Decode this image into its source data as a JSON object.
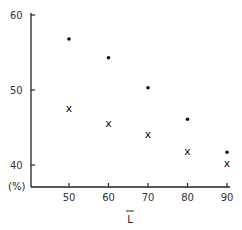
{
  "chart_data": {
    "type": "scatter",
    "title": "",
    "xlabel": "L̄",
    "ylabel": "(%)",
    "x": [
      50,
      60,
      70,
      80,
      90
    ],
    "series": [
      {
        "name": "dot",
        "marker": "•",
        "values": [
          56.8,
          54.3,
          50.3,
          46.1,
          41.7
        ]
      },
      {
        "name": "cross",
        "marker": "x",
        "values": [
          47.6,
          45.6,
          44.1,
          41.9,
          40.3
        ]
      }
    ],
    "xticks": [
      "50",
      "60",
      "70",
      "80",
      "90"
    ],
    "yticks": [
      "40",
      "50",
      "60"
    ],
    "xlim": [
      40,
      90
    ],
    "ylim": [
      37,
      60
    ],
    "grid": false,
    "legend": null
  }
}
